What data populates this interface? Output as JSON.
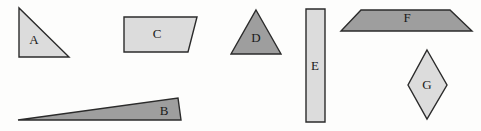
{
  "figure": {
    "name": "geometric-shapes-figure",
    "background_color": "#fdfdfc",
    "width": 481,
    "height": 131,
    "outline_color": "#2b2b2b",
    "fill_light": "#dcdcdc",
    "fill_dark": "#9e9e9e",
    "label_color": "#1a1a1a"
  },
  "shapes": [
    {
      "id": "A",
      "label": "A",
      "type": "right-triangle",
      "fill": "#dcdcdc",
      "stroke": "#2b2b2b",
      "points": "19,8 19,57 69,57",
      "label_x": 34,
      "label_y": 41
    },
    {
      "id": "B",
      "label": "B",
      "type": "thin-wedge-triangle",
      "fill": "#9e9e9e",
      "stroke": "#2b2b2b",
      "points": "18,120 178,98 181,120",
      "label_x": 164,
      "label_y": 112
    },
    {
      "id": "C",
      "label": "C",
      "type": "trapezoid",
      "fill": "#dcdcdc",
      "stroke": "#2b2b2b",
      "points": "124,17 197,17 188,52 124,52",
      "label_x": 157,
      "label_y": 35
    },
    {
      "id": "D",
      "label": "D",
      "type": "isosceles-triangle",
      "fill": "#9e9e9e",
      "stroke": "#2b2b2b",
      "points": "256,10 281,54 231,54",
      "label_x": 256,
      "label_y": 39
    },
    {
      "id": "E",
      "label": "E",
      "type": "tall-rectangle",
      "fill": "#dcdcdc",
      "stroke": "#2b2b2b",
      "points": "306,9 325,9 325,122 306,122",
      "label_x": 315,
      "label_y": 67
    },
    {
      "id": "F",
      "label": "F",
      "type": "wide-trapezoid",
      "fill": "#9e9e9e",
      "stroke": "#2b2b2b",
      "points": "361,10 450,10 472,31 341,31",
      "label_x": 407,
      "label_y": 19
    },
    {
      "id": "G",
      "label": "G",
      "type": "rhombus",
      "fill": "#dcdcdc",
      "stroke": "#2b2b2b",
      "points": "427,50 447,85 427,119 408,85",
      "label_x": 427,
      "label_y": 86
    }
  ]
}
